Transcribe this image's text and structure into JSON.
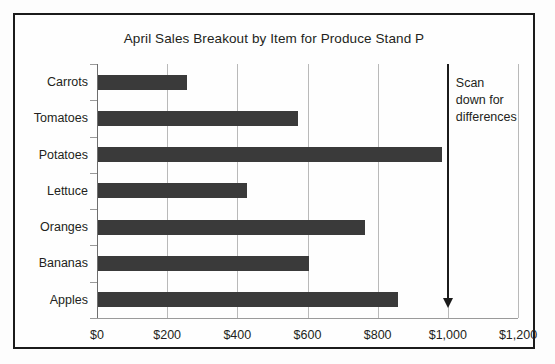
{
  "chart_data": {
    "type": "bar",
    "orientation": "horizontal",
    "title": "April Sales Breakout by Item for Produce Stand P",
    "xlabel": "",
    "ylabel": "",
    "categories": [
      "Carrots",
      "Tomatoes",
      "Potatoes",
      "Lettuce",
      "Oranges",
      "Bananas",
      "Apples"
    ],
    "values": [
      255,
      570,
      980,
      425,
      760,
      600,
      855
    ],
    "xlim": [
      0,
      1200
    ],
    "xticks": [
      0,
      200,
      400,
      600,
      800,
      1000,
      1200
    ],
    "xtick_labels": [
      "$0",
      "$200",
      "$400",
      "$600",
      "$800",
      "$1,000",
      "$1,200"
    ],
    "grid": "vertical",
    "legend": "none",
    "bar_color": "#3a3a3a",
    "gridline_color": "#b9b9b9",
    "axis_color": "#6e6e6e",
    "text_color": "#231f20",
    "frame_color": "#1b1b1b",
    "annotations": [
      {
        "name": "scan-down-arrow",
        "text_lines": [
          "Scan",
          "down for",
          "differences"
        ],
        "at_value": 1000,
        "direction": "down"
      }
    ]
  }
}
